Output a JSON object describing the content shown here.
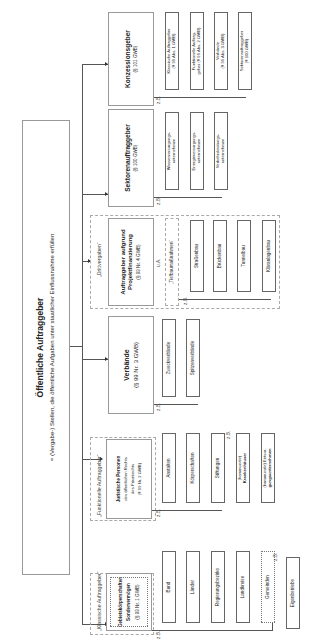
{
  "title": {
    "heading": "Öffentliche Auftraggeber",
    "subtitle": "= (Vergabe-) Stellen, die öffentliche Aufgaben unter staatlicher Einflussnahme erfüllen"
  },
  "labels": {
    "zb": "z.B.",
    "ua": "u.A."
  },
  "categories": {
    "klassische": {
      "tag": "„Klassische Auftraggeber“",
      "line1": "Gebietskörperschaften",
      "line2": "Sondervermögen",
      "ref": "(§ 99 Nr. 1 GWB)",
      "items": [
        "Bund",
        "Länder",
        "Regierungsbezirke",
        "Landkreise",
        "Gemeinden",
        "Eigenbetriebe"
      ]
    },
    "funktionelle": {
      "tag": "„Funktionelle Auftraggeber“",
      "line1": "Juristische Personen",
      "line2": "des öffentlichen Rechts",
      "line3": "des Privatrechts",
      "ref": "(§ 99 Nr. 2 GWB)",
      "items": [
        "Anstalten",
        "Körperschaften",
        "Stiftungen"
      ],
      "extra": [
        {
          "top": "(kommunale)",
          "bottom": "Krankenhäuser"
        },
        {
          "top": "(kommunale) Entsor-",
          "bottom": "gungsunternehmen"
        }
      ]
    },
    "verbaende": {
      "title": "Verbände",
      "ref": "(§ 99 Nr. 3 GWB)",
      "items": [
        "Zweckverbände",
        "Spitzenverbände"
      ]
    },
    "projekt": {
      "tag": "„Drittvergaben“",
      "title1": "Auftraggeber aufgrund",
      "title2": "Projektfinanzierung",
      "ref": "(§ 99 Nr. 4 GWB)",
      "sub": "„Tiefbaumaßnahmen“",
      "items": [
        "Straßenbau",
        "Brückenbau",
        "Tunnelbau",
        "Kläranlagenbau"
      ]
    },
    "sektoren": {
      "title": "Sektorenauftraggeber",
      "ref": "(§ 100 GWB)",
      "items": [
        {
          "l1": "Wasserversorgungs-",
          "l2": "unternehmen"
        },
        {
          "l1": "Energieversorgungs-",
          "l2": "unternehmen"
        },
        {
          "l1": "Verkehrsleistungs-",
          "l2": "unternehmen"
        }
      ]
    },
    "konzession": {
      "title": "Konzessionsgeber",
      "ref": "(§ 101 GWB)",
      "items": [
        {
          "l1": "Klassische Auftraggeber",
          "l2": "(§ 99 Abs. 1 GWB)"
        },
        {
          "l1": "Funktionelle Auftrag-",
          "l2": "geber (§ 99 Abs. 2 GWB)"
        },
        {
          "l1": "Verbände",
          "l2": "(§ 99 Abs. 3 GWB)"
        },
        {
          "l1": "Sektorenauftraggeber",
          "l2": "(§ 100 GWB)"
        }
      ]
    }
  }
}
